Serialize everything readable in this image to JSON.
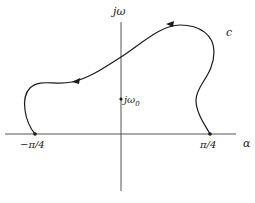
{
  "diagram": {
    "type": "complex-plane-contour",
    "axes": {
      "vertical_label": "jω",
      "horizontal_label": "α"
    },
    "points": [
      {
        "id": "left-endpoint",
        "label": "−π/4"
      },
      {
        "id": "right-endpoint",
        "label": "π/4"
      },
      {
        "id": "j-omega-0",
        "label": "jω",
        "subscript": "0"
      }
    ],
    "curve": {
      "label": "c",
      "direction": "from π/4 counter-clockwise up and over to −π/4"
    },
    "colors": {
      "stroke": "#1a1a1a",
      "axis": "#555555",
      "background": "#ffffff"
    }
  }
}
